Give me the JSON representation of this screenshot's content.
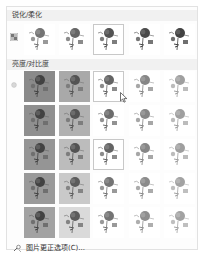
{
  "panel": {
    "sections": [
      {
        "id": "sharpen",
        "title": "锐化/柔化",
        "icon": "sharpen-grid-icon",
        "thumbnails": [
          {
            "label": "柔化: 50%",
            "bg": "#ffffff",
            "ink": 0.55,
            "selected": false
          },
          {
            "label": "柔化: 25%",
            "bg": "#ffffff",
            "ink": 0.65,
            "selected": false
          },
          {
            "label": "锐化: 0%",
            "bg": "#ffffff",
            "ink": 0.75,
            "selected": true
          },
          {
            "label": "锐化: 25%",
            "bg": "#ffffff",
            "ink": 0.8,
            "selected": false
          },
          {
            "label": "锐化: 50%",
            "bg": "#ffffff",
            "ink": 0.85,
            "selected": false
          }
        ]
      },
      {
        "id": "brightness",
        "title": "亮度/对比度",
        "icon": "brightness-sun-icon",
        "rows": [
          [
            {
              "bg": "#8a8a8a",
              "ink": 0.85,
              "selected": false
            },
            {
              "bg": "#a9a9a9",
              "ink": 0.75,
              "selected": false
            },
            {
              "bg": "#ffffff",
              "ink": 0.65,
              "selected": true
            },
            {
              "bg": "#ffffff",
              "ink": 0.45,
              "selected": false
            },
            {
              "bg": "#ffffff",
              "ink": 0.3,
              "selected": false
            }
          ],
          [
            {
              "bg": "#8f8f8f",
              "ink": 0.85,
              "selected": false
            },
            {
              "bg": "#b1b1b1",
              "ink": 0.75,
              "selected": false
            },
            {
              "bg": "#ffffff",
              "ink": 0.6,
              "selected": false
            },
            {
              "bg": "#ffffff",
              "ink": 0.45,
              "selected": false
            },
            {
              "bg": "#ffffff",
              "ink": 0.3,
              "selected": false
            }
          ],
          [
            {
              "bg": "#959595",
              "ink": 0.85,
              "selected": false
            },
            {
              "bg": "#bcbcbc",
              "ink": 0.75,
              "selected": false
            },
            {
              "bg": "#ffffff",
              "ink": 0.65,
              "selected": true
            },
            {
              "bg": "#ffffff",
              "ink": 0.45,
              "selected": false
            },
            {
              "bg": "#ffffff",
              "ink": 0.3,
              "selected": false
            }
          ],
          [
            {
              "bg": "#9a9a9a",
              "ink": 0.85,
              "selected": false
            },
            {
              "bg": "#c9c9c9",
              "ink": 0.7,
              "selected": false
            },
            {
              "bg": "#ffffff",
              "ink": 0.55,
              "selected": false
            },
            {
              "bg": "#ffffff",
              "ink": 0.42,
              "selected": false
            },
            {
              "bg": "#ffffff",
              "ink": 0.28,
              "selected": false
            }
          ],
          [
            {
              "bg": "#a2a2a2",
              "ink": 0.85,
              "selected": false
            },
            {
              "bg": "#dadada",
              "ink": 0.7,
              "selected": false
            },
            {
              "bg": "#ffffff",
              "ink": 0.55,
              "selected": false
            },
            {
              "bg": "#ffffff",
              "ink": 0.4,
              "selected": false
            },
            {
              "bg": "#ffffff",
              "ink": 0.28,
              "selected": false
            }
          ]
        ]
      }
    ],
    "footer": {
      "label": "图片更正选项(C)...",
      "icon": "picture-corrections-icon"
    }
  },
  "colors": {
    "panel_bg": "#fdfdfd",
    "panel_border": "#e2e2e2",
    "header_bg": "#f1f1f1",
    "selected_outline": "#c8c8c8"
  }
}
